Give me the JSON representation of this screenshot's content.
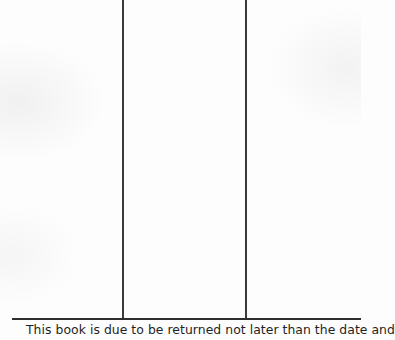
{
  "document": {
    "type": "library-date-due-slip",
    "columns": [
      {
        "label": "",
        "value": ""
      },
      {
        "label": "",
        "value": ""
      },
      {
        "label": "",
        "value": ""
      }
    ],
    "notice_text": "This book is due to be returned not later than the date and"
  },
  "colors": {
    "paper": "#fdfdfd",
    "rule_lines": "#333333",
    "text": "#1f1f1f"
  }
}
